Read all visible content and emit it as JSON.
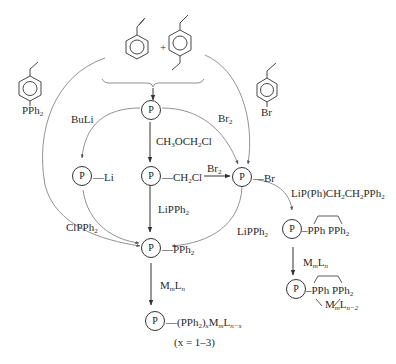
{
  "diagram": {
    "type": "reaction-scheme",
    "title": "",
    "reactants": {
      "styrene": "styrene",
      "plus": "+",
      "divinylbenzene": "divinylbenzene",
      "vinyl_pph2": {
        "substituent": "PPh",
        "sub": "2"
      },
      "vinyl_br": {
        "substituent": "Br"
      }
    },
    "nodes": {
      "polymer": {
        "label": "P"
      },
      "p_li": {
        "circle": "P",
        "group": "Li"
      },
      "p_ch2cl": {
        "circle": "P",
        "group_pre": "CH",
        "group_sub": "2",
        "group_post": "Cl"
      },
      "p_br": {
        "circle": "P",
        "group": "Br"
      },
      "p_pph2": {
        "circle": "P",
        "group_pre": "PPh",
        "group_sub": "2"
      },
      "p_complex": {
        "circle": "P",
        "text1": "(PPh",
        "sub1": "2",
        "text2": ")",
        "x": "x",
        "text3": "M",
        "m": "m",
        "text4": "L",
        "n": "n−x"
      },
      "x_range": "(x = 1–3)",
      "p_chelate": {
        "circle": "P",
        "pph": "PPh",
        "pph2": "PPh",
        "pph2_sub": "2"
      },
      "p_chelate_complex": {
        "circle": "P",
        "pph": "PPh",
        "pph2": "PPh",
        "pph2_sub": "2",
        "metal": "M",
        "m": "m",
        "ligand": "L",
        "n": "n−2"
      }
    },
    "reagents": {
      "buli": "BuLi",
      "br2_top": {
        "pre": "Br",
        "sub": "2"
      },
      "ch3och2cl": {
        "a": "CH",
        "a_sub": "3",
        "b": "OCH",
        "b_sub": "2",
        "c": "Cl"
      },
      "br2_mid": {
        "pre": "Br",
        "sub": "2"
      },
      "lipph2_center": {
        "pre": "LiPPh",
        "sub": "2"
      },
      "lipph2_right": {
        "pre": "LiPPh",
        "sub": "2"
      },
      "clpph2": {
        "pre": "ClPPh",
        "sub": "2"
      },
      "mmln_center": {
        "M": "M",
        "m": "m",
        "L": "L",
        "n": "n"
      },
      "lip_chain": {
        "a": "LiP(Ph)CH",
        "a_sub": "2",
        "b": "CH",
        "b_sub": "2",
        "c": "PPh",
        "c_sub": "2"
      },
      "mmln_right": {
        "M": "M",
        "m": "m",
        "L": "L",
        "n": "n"
      }
    },
    "colors": {
      "line": "#333333",
      "curve": "#777777",
      "text": "#2a2a2a"
    }
  }
}
